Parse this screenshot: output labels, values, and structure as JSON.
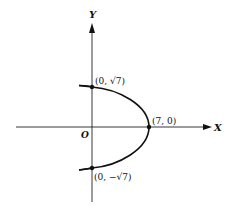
{
  "diagram": {
    "type": "parabola",
    "equation_hint": "x = 7 - y^2",
    "axes": {
      "x_label": "X",
      "y_label": "Y",
      "origin_label": "O"
    },
    "points": [
      {
        "name": "top-intercept",
        "label": "(0, √7)",
        "x": 0,
        "y": 2.6458
      },
      {
        "name": "vertex",
        "label": "(7, 0)",
        "x": 7,
        "y": 0
      },
      {
        "name": "bottom-intercept",
        "label": "(0, −√7)",
        "x": 0,
        "y": -2.6458
      }
    ],
    "colors": {
      "ink": "#111111",
      "background": "#ffffff"
    }
  }
}
